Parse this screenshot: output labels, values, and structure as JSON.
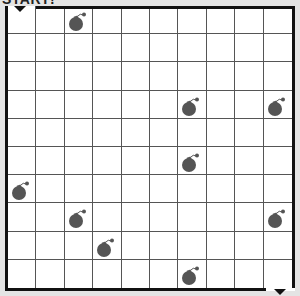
{
  "title": "START!",
  "grid": {
    "rows": 10,
    "cols": 10
  },
  "start_marker": {
    "col": 0,
    "row": 0,
    "icon": "down-arrow-icon"
  },
  "end_marker": {
    "col": 9,
    "row": 9,
    "icon": "down-arrow-icon"
  },
  "bombs": [
    {
      "col": 2,
      "row": 0
    },
    {
      "col": 6,
      "row": 3
    },
    {
      "col": 9,
      "row": 3
    },
    {
      "col": 6,
      "row": 5
    },
    {
      "col": 0,
      "row": 6
    },
    {
      "col": 2,
      "row": 7
    },
    {
      "col": 9,
      "row": 7
    },
    {
      "col": 3,
      "row": 8
    },
    {
      "col": 6,
      "row": 9
    }
  ],
  "colors": {
    "bomb": "#555555",
    "grid_line": "#555555",
    "border": "#111111"
  }
}
